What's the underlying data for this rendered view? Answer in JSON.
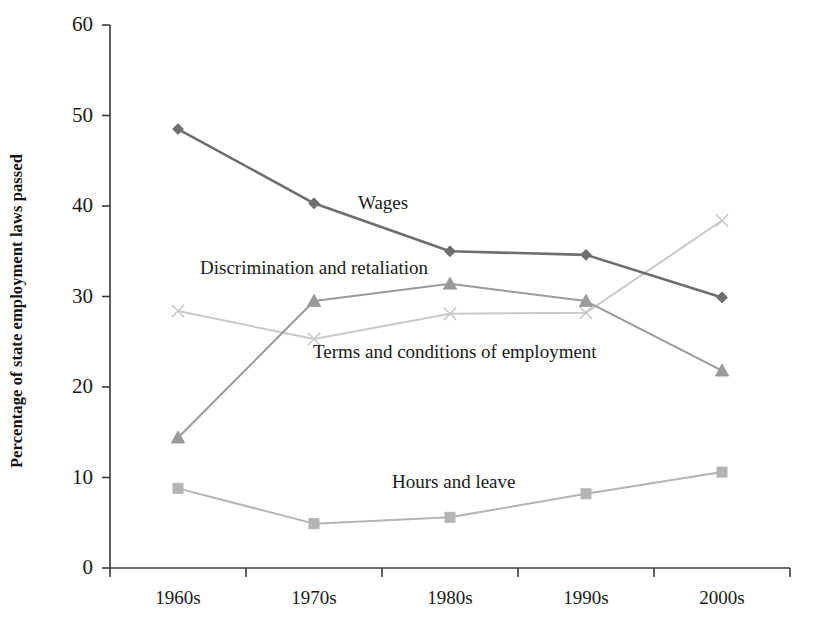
{
  "chart_data": {
    "type": "line",
    "title": "",
    "subtitle": "",
    "xlabel": "",
    "ylabel": "Percentage of state employment laws passed",
    "categories": [
      "1960s",
      "1970s",
      "1980s",
      "1990s",
      "2000s"
    ],
    "ylim": [
      0,
      60
    ],
    "yticks": [
      0,
      10,
      20,
      30,
      40,
      50,
      60
    ],
    "ytick_labels": [
      "0",
      "10",
      "20",
      "30",
      "40",
      "50",
      "60"
    ],
    "grid": false,
    "legend_position": "inline-annotations",
    "series": [
      {
        "name": "Wages",
        "values": [
          48.5,
          40.3,
          35.0,
          34.6,
          29.9
        ],
        "color": "#6e6e6e",
        "marker": "diamond",
        "label_text": "Wages"
      },
      {
        "name": "Discrimination and retaliation",
        "values": [
          14.4,
          29.5,
          31.4,
          29.5,
          21.8
        ],
        "color": "#9a9a9a",
        "marker": "triangle",
        "label_text": "Discrimination and retaliation"
      },
      {
        "name": "Terms and conditions of employment",
        "values": [
          28.4,
          25.3,
          28.1,
          28.2,
          38.4
        ],
        "color": "#c9c9c9",
        "marker": "x",
        "label_text": "Terms and conditions of employment"
      },
      {
        "name": "Hours and leave",
        "values": [
          8.8,
          4.9,
          5.6,
          8.2,
          10.6
        ],
        "color": "#b4b4b4",
        "marker": "square",
        "label_text": "Hours and leave"
      }
    ],
    "axis_color": "#3a3a3a"
  },
  "axes": {
    "y_title": "Percentage of state employment laws passed",
    "y_ticks": [
      "60",
      "50",
      "40",
      "30",
      "20",
      "10",
      "0"
    ],
    "x_ticks": [
      "1960s",
      "1970s",
      "1980s",
      "1990s",
      "2000s"
    ]
  },
  "annotations": {
    "wages": "Wages",
    "discrimination": "Discrimination and retaliation",
    "terms": "Terms and conditions of employment",
    "hours": "Hours and leave"
  }
}
